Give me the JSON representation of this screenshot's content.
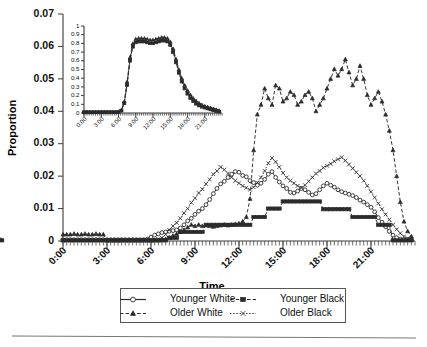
{
  "figure": {
    "background": "#ffffff",
    "ink_color": "#2b2b2b"
  },
  "main_axes": {
    "ylabel": "Proportion",
    "xlabel": "Time",
    "y_ticks": [
      "0",
      "0.01",
      "0.02",
      "0.03",
      "0.04",
      "0.05",
      "0.06",
      "0.07"
    ],
    "x_ticks": [
      "0:00",
      "3:00",
      "6:00",
      "9:00",
      "12:00",
      "15:00",
      "18:00",
      "21:00"
    ]
  },
  "inset_axes": {
    "y_ticks": [
      "0",
      "0.1",
      "0.2",
      "0.3",
      "0.4",
      "0.5",
      "0.6",
      "0.7",
      "0.8",
      "0.9",
      "1"
    ],
    "x_ticks": [
      "0:00",
      "3:00",
      "6:00",
      "9:00",
      "12:00",
      "15:00",
      "18:00",
      "21:00"
    ]
  },
  "legend": {
    "entries": [
      {
        "label": "Younger White",
        "marker": "open-circle",
        "dash": "none"
      },
      {
        "label": "Younger Black",
        "marker": "filled-circle",
        "dash": "dash"
      },
      {
        "label": "Older White",
        "marker": "filled-triangle",
        "dash": "dash"
      },
      {
        "label": "Older Black",
        "marker": "cross",
        "dash": "dot"
      }
    ]
  },
  "chart_data": {
    "type": "line",
    "title": "",
    "xlabel": "Time",
    "ylabel": "Proportion",
    "xlim": [
      "0:00",
      "24:00"
    ],
    "ylim": [
      0,
      0.07
    ],
    "grid": false,
    "legend_position": "below-axes",
    "x_tick_labels": [
      "0:00",
      "3:00",
      "6:00",
      "9:00",
      "12:00",
      "15:00",
      "18:00",
      "21:00"
    ],
    "y_tick_labels": [
      "0",
      "0.01",
      "0.02",
      "0.03",
      "0.04",
      "0.05",
      "0.06",
      "0.07"
    ],
    "x_hours": [
      0,
      0.25,
      0.5,
      0.75,
      1,
      1.25,
      1.5,
      1.75,
      2,
      2.25,
      2.5,
      2.75,
      3,
      3.25,
      3.5,
      3.75,
      4,
      4.25,
      4.5,
      4.75,
      5,
      5.25,
      5.5,
      5.75,
      6,
      6.25,
      6.5,
      6.75,
      7,
      7.25,
      7.5,
      7.75,
      8,
      8.25,
      8.5,
      8.75,
      9,
      9.25,
      9.5,
      9.75,
      10,
      10.25,
      10.5,
      10.75,
      11,
      11.25,
      11.5,
      11.75,
      12,
      12.25,
      12.5,
      12.75,
      13,
      13.25,
      13.5,
      13.75,
      14,
      14.25,
      14.5,
      14.75,
      15,
      15.25,
      15.5,
      15.75,
      16,
      16.25,
      16.5,
      16.75,
      17,
      17.25,
      17.5,
      17.75,
      18,
      18.25,
      18.5,
      18.75,
      19,
      19.25,
      19.5,
      19.75,
      20,
      20.25,
      20.5,
      20.75,
      21,
      21.25,
      21.5,
      21.75,
      22,
      22.25,
      22.5,
      22.75,
      23,
      23.25,
      23.5,
      23.75
    ],
    "series": [
      {
        "name": "Younger White",
        "marker": "open-circle",
        "dash": "none",
        "values": [
          0.0004,
          0.0004,
          0.0004,
          0.0004,
          0.0004,
          0.0004,
          0.0004,
          0.0004,
          0.0004,
          0.0004,
          0.0004,
          0.0004,
          0.0004,
          0.0004,
          0.0004,
          0.0004,
          0.0004,
          0.0004,
          0.0004,
          0.0004,
          0.0004,
          0.0004,
          0.0004,
          0.0006,
          0.0012,
          0.0018,
          0.0022,
          0.0026,
          0.0028,
          0.003,
          0.0032,
          0.0034,
          0.004,
          0.005,
          0.0062,
          0.007,
          0.0082,
          0.0092,
          0.01,
          0.0112,
          0.0128,
          0.0146,
          0.0162,
          0.0176,
          0.0184,
          0.0196,
          0.0206,
          0.0214,
          0.0212,
          0.0202,
          0.0198,
          0.0186,
          0.018,
          0.0172,
          0.0178,
          0.019,
          0.0206,
          0.0214,
          0.0196,
          0.0182,
          0.017,
          0.0162,
          0.015,
          0.0148,
          0.0154,
          0.0162,
          0.0158,
          0.015,
          0.0142,
          0.0146,
          0.0158,
          0.017,
          0.0178,
          0.0172,
          0.0166,
          0.0158,
          0.0152,
          0.0148,
          0.0144,
          0.014,
          0.0134,
          0.0126,
          0.012,
          0.0112,
          0.0104,
          0.009,
          0.0072,
          0.0058,
          0.0044,
          0.003,
          0.0018,
          0.001,
          0.0006,
          0.0004,
          0.0004,
          0.0004,
          0.0004
        ]
      },
      {
        "name": "Younger Black",
        "marker": "filled-circle",
        "dash": "dash",
        "values": [
          0.0002,
          0.0002,
          0.0002,
          0.0002,
          0.0002,
          0.0002,
          0.0002,
          0.0002,
          0.0002,
          0.0002,
          0.0002,
          0.0002,
          0.0002,
          0.0002,
          0.0002,
          0.0002,
          0.0002,
          0.0002,
          0.0002,
          0.0002,
          0.0002,
          0.0002,
          0.0002,
          0.0002,
          0.0002,
          0.0002,
          0.0002,
          0.0002,
          0.0002,
          0.001,
          0.001,
          0.001,
          0.0028,
          0.0028,
          0.0028,
          0.0028,
          0.0028,
          0.0028,
          0.0028,
          0.005,
          0.005,
          0.005,
          0.005,
          0.005,
          0.005,
          0.005,
          0.005,
          0.005,
          0.005,
          0.005,
          0.005,
          0.005,
          0.0074,
          0.0074,
          0.0074,
          0.0074,
          0.01,
          0.01,
          0.01,
          0.01,
          0.0122,
          0.0122,
          0.0122,
          0.0122,
          0.0122,
          0.0122,
          0.0122,
          0.0122,
          0.0122,
          0.0122,
          0.0122,
          0.0098,
          0.0098,
          0.0098,
          0.0098,
          0.0098,
          0.0098,
          0.0098,
          0.0098,
          0.0074,
          0.0074,
          0.0074,
          0.0074,
          0.0074,
          0.0074,
          0.0074,
          0.005,
          0.005,
          0.005,
          0.005,
          0.0002,
          0.0002,
          0.0002,
          0.0002,
          0.0002,
          0.0002,
          0.0002
        ]
      },
      {
        "name": "Older White",
        "marker": "filled-triangle",
        "dash": "dash",
        "values": [
          0.002,
          0.002,
          0.002,
          0.0022,
          0.002,
          0.002,
          0.0022,
          0.002,
          0.002,
          0.0022,
          0.002,
          0.002,
          0.0002,
          0.0002,
          0.0002,
          0.0002,
          0.0002,
          0.0002,
          0.0002,
          0.0002,
          0.0002,
          0.0002,
          0.0002,
          0.0002,
          0.0002,
          0.0002,
          0.0002,
          0.0004,
          0.0006,
          0.001,
          0.0016,
          0.0022,
          0.0028,
          0.0034,
          0.0042,
          0.005,
          0.0046,
          0.005,
          0.0046,
          0.0048,
          0.0046,
          0.0044,
          0.0046,
          0.0048,
          0.005,
          0.0048,
          0.005,
          0.0052,
          0.0054,
          0.006,
          0.0074,
          0.013,
          0.028,
          0.039,
          0.042,
          0.047,
          0.044,
          0.042,
          0.048,
          0.047,
          0.043,
          0.044,
          0.046,
          0.045,
          0.042,
          0.043,
          0.045,
          0.046,
          0.044,
          0.04,
          0.042,
          0.044,
          0.047,
          0.05,
          0.053,
          0.051,
          0.053,
          0.056,
          0.052,
          0.048,
          0.05,
          0.054,
          0.05,
          0.045,
          0.042,
          0.044,
          0.046,
          0.043,
          0.039,
          0.034,
          0.028,
          0.02,
          0.012,
          0.006,
          0.003,
          0.0014,
          0.0006
        ]
      },
      {
        "name": "Older Black",
        "marker": "cross",
        "dash": "dot",
        "values": [
          0.0002,
          0.0002,
          0.0002,
          0.0002,
          0.0002,
          0.0002,
          0.0002,
          0.0002,
          0.0002,
          0.0002,
          0.0002,
          0.0002,
          0.0002,
          0.0002,
          0.0002,
          0.0002,
          0.0002,
          0.0002,
          0.0002,
          0.0002,
          0.0002,
          0.0002,
          0.0002,
          0.0002,
          0.0002,
          0.0004,
          0.0006,
          0.001,
          0.002,
          0.0034,
          0.0046,
          0.0056,
          0.007,
          0.0086,
          0.01,
          0.0118,
          0.0132,
          0.0148,
          0.016,
          0.0176,
          0.019,
          0.0206,
          0.0216,
          0.0228,
          0.022,
          0.0208,
          0.0196,
          0.0186,
          0.0178,
          0.017,
          0.0164,
          0.0158,
          0.0166,
          0.018,
          0.0196,
          0.0216,
          0.024,
          0.0256,
          0.0244,
          0.0228,
          0.021,
          0.0196,
          0.0186,
          0.0178,
          0.017,
          0.0164,
          0.0172,
          0.0184,
          0.0196,
          0.0208,
          0.0216,
          0.0226,
          0.0232,
          0.0238,
          0.0246,
          0.0252,
          0.0258,
          0.0248,
          0.0236,
          0.0224,
          0.0212,
          0.02,
          0.0186,
          0.017,
          0.0152,
          0.0134,
          0.0116,
          0.0098,
          0.0082,
          0.0066,
          0.005,
          0.0036,
          0.0024,
          0.0014,
          0.0008,
          0.0004,
          0.0002
        ]
      }
    ]
  },
  "inset_chart_data": {
    "type": "line",
    "title": "",
    "xlabel": "",
    "ylabel": "",
    "ylim": [
      0,
      1
    ],
    "grid": false,
    "x_tick_labels": [
      "0:00",
      "3:00",
      "6:00",
      "9:00",
      "12:00",
      "15:00",
      "18:00",
      "21:00"
    ],
    "y_tick_labels": [
      "0",
      "0.1",
      "0.2",
      "0.3",
      "0.4",
      "0.5",
      "0.6",
      "0.7",
      "0.8",
      "0.9",
      "1"
    ],
    "x_hours": [
      0,
      0.5,
      1,
      1.5,
      2,
      2.5,
      3,
      3.5,
      4,
      4.5,
      5,
      5.5,
      6,
      6.5,
      7,
      7.5,
      8,
      8.5,
      9,
      9.5,
      10,
      10.5,
      11,
      11.5,
      12,
      12.5,
      13,
      13.5,
      14,
      14.5,
      15,
      15.5,
      16,
      16.5,
      17,
      17.5,
      18,
      18.5,
      19,
      19.5,
      20,
      20.5,
      21,
      21.5,
      22,
      22.5,
      23,
      23.5
    ],
    "series": [
      {
        "name": "Younger White",
        "marker": "open-circle",
        "dash": "none",
        "values": [
          0.01,
          0.01,
          0.01,
          0.01,
          0.01,
          0.01,
          0.01,
          0.01,
          0.01,
          0.01,
          0.01,
          0.01,
          0.012,
          0.03,
          0.12,
          0.34,
          0.62,
          0.78,
          0.83,
          0.84,
          0.84,
          0.84,
          0.83,
          0.82,
          0.82,
          0.83,
          0.84,
          0.85,
          0.85,
          0.84,
          0.8,
          0.72,
          0.6,
          0.48,
          0.38,
          0.3,
          0.24,
          0.19,
          0.15,
          0.12,
          0.1,
          0.08,
          0.07,
          0.06,
          0.05,
          0.04,
          0.03,
          0.02
        ]
      },
      {
        "name": "Younger Black",
        "marker": "filled-circle",
        "dash": "dash",
        "values": [
          0.008,
          0.008,
          0.008,
          0.008,
          0.008,
          0.008,
          0.008,
          0.008,
          0.008,
          0.008,
          0.008,
          0.008,
          0.01,
          0.026,
          0.11,
          0.32,
          0.6,
          0.76,
          0.81,
          0.82,
          0.82,
          0.82,
          0.81,
          0.8,
          0.8,
          0.81,
          0.82,
          0.83,
          0.83,
          0.82,
          0.78,
          0.7,
          0.58,
          0.46,
          0.36,
          0.28,
          0.22,
          0.17,
          0.135,
          0.105,
          0.085,
          0.07,
          0.06,
          0.05,
          0.04,
          0.03,
          0.022,
          0.015
        ]
      },
      {
        "name": "Older White",
        "marker": "filled-triangle",
        "dash": "dash",
        "values": [
          0.012,
          0.012,
          0.012,
          0.012,
          0.012,
          0.012,
          0.012,
          0.012,
          0.012,
          0.012,
          0.012,
          0.012,
          0.014,
          0.034,
          0.13,
          0.36,
          0.64,
          0.8,
          0.85,
          0.86,
          0.86,
          0.86,
          0.85,
          0.84,
          0.84,
          0.85,
          0.86,
          0.87,
          0.87,
          0.86,
          0.82,
          0.74,
          0.62,
          0.5,
          0.4,
          0.32,
          0.26,
          0.21,
          0.17,
          0.14,
          0.115,
          0.095,
          0.08,
          0.07,
          0.06,
          0.05,
          0.04,
          0.03
        ]
      },
      {
        "name": "Older Black",
        "marker": "cross",
        "dash": "dot",
        "values": [
          0.009,
          0.009,
          0.009,
          0.009,
          0.009,
          0.009,
          0.009,
          0.009,
          0.009,
          0.009,
          0.009,
          0.009,
          0.011,
          0.028,
          0.115,
          0.33,
          0.61,
          0.77,
          0.82,
          0.83,
          0.83,
          0.83,
          0.82,
          0.81,
          0.81,
          0.82,
          0.83,
          0.84,
          0.84,
          0.83,
          0.79,
          0.71,
          0.59,
          0.47,
          0.37,
          0.29,
          0.23,
          0.18,
          0.14,
          0.11,
          0.09,
          0.075,
          0.065,
          0.055,
          0.045,
          0.035,
          0.025,
          0.018
        ]
      }
    ]
  }
}
